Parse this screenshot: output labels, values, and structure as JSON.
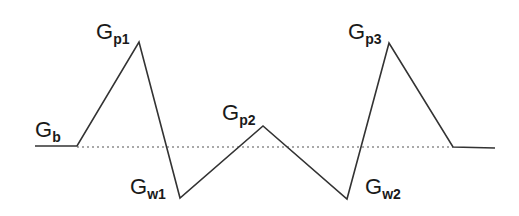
{
  "diagram": {
    "type": "waveform",
    "colors": {
      "line": "#333333",
      "baseline": "#555555",
      "text": "#1a1a1a",
      "background": "#ffffff"
    },
    "polyline": [
      [
        35,
        146
      ],
      [
        77,
        146
      ],
      [
        139,
        42
      ],
      [
        180,
        198
      ],
      [
        263,
        126
      ],
      [
        347,
        199
      ],
      [
        389,
        43
      ],
      [
        453,
        147
      ],
      [
        495,
        148
      ]
    ],
    "baseline": {
      "style": "dotted",
      "y": 147,
      "x1": 77,
      "x2": 453
    },
    "labels": [
      {
        "id": "gb",
        "main": "G",
        "sub": "b",
        "x": 35,
        "y": 137
      },
      {
        "id": "gp1",
        "main": "G",
        "sub": "p1",
        "x": 96,
        "y": 39
      },
      {
        "id": "gw1",
        "main": "G",
        "sub": "w1",
        "x": 130,
        "y": 194
      },
      {
        "id": "gp2",
        "main": "G",
        "sub": "p2",
        "x": 222,
        "y": 120
      },
      {
        "id": "gw2",
        "main": "G",
        "sub": "w2",
        "x": 365,
        "y": 194
      },
      {
        "id": "gp3",
        "main": "G",
        "sub": "p3",
        "x": 348,
        "y": 39
      }
    ]
  }
}
